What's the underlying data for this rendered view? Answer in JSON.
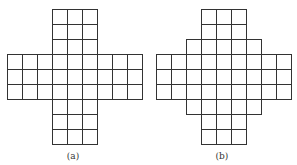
{
  "diagram": {
    "cell_size": 15,
    "line_color": "#333333",
    "background": "#ffffff",
    "figures": [
      {
        "id": "a",
        "caption": "(a)",
        "origin_x": 7,
        "origin_y": 9,
        "description": "Plus-shaped grid: a 3-column by 9-row vertical arm crossing a 9-column by 3-row horizontal arm",
        "rows": [
          {
            "row": 0,
            "cols": [
              3,
              4,
              5
            ]
          },
          {
            "row": 1,
            "cols": [
              3,
              4,
              5
            ]
          },
          {
            "row": 2,
            "cols": [
              3,
              4,
              5
            ]
          },
          {
            "row": 3,
            "cols": [
              0,
              1,
              2,
              3,
              4,
              5,
              6,
              7,
              8
            ]
          },
          {
            "row": 4,
            "cols": [
              0,
              1,
              2,
              3,
              4,
              5,
              6,
              7,
              8
            ]
          },
          {
            "row": 5,
            "cols": [
              0,
              1,
              2,
              3,
              4,
              5,
              6,
              7,
              8
            ]
          },
          {
            "row": 6,
            "cols": [
              3,
              4,
              5
            ]
          },
          {
            "row": 7,
            "cols": [
              3,
              4,
              5
            ]
          },
          {
            "row": 8,
            "cols": [
              3,
              4,
              5
            ]
          }
        ],
        "cell_count": 45
      },
      {
        "id": "b",
        "caption": "(b)",
        "origin_x": 156,
        "origin_y": 9,
        "description": "Stepped plus-shaped grid: 3-wide top/bottom arms, a 5-wide step row above and below a 9-column by 3-row horizontal band",
        "rows": [
          {
            "row": 0,
            "cols": [
              3,
              4,
              5
            ]
          },
          {
            "row": 1,
            "cols": [
              3,
              4,
              5
            ]
          },
          {
            "row": 2,
            "cols": [
              2,
              3,
              4,
              5,
              6
            ]
          },
          {
            "row": 3,
            "cols": [
              0,
              1,
              2,
              3,
              4,
              5,
              6,
              7,
              8
            ]
          },
          {
            "row": 4,
            "cols": [
              0,
              1,
              2,
              3,
              4,
              5,
              6,
              7,
              8
            ]
          },
          {
            "row": 5,
            "cols": [
              0,
              1,
              2,
              3,
              4,
              5,
              6,
              7,
              8
            ]
          },
          {
            "row": 6,
            "cols": [
              2,
              3,
              4,
              5,
              6
            ]
          },
          {
            "row": 7,
            "cols": [
              3,
              4,
              5
            ]
          },
          {
            "row": 8,
            "cols": [
              3,
              4,
              5
            ]
          }
        ],
        "cell_count": 49
      }
    ]
  }
}
